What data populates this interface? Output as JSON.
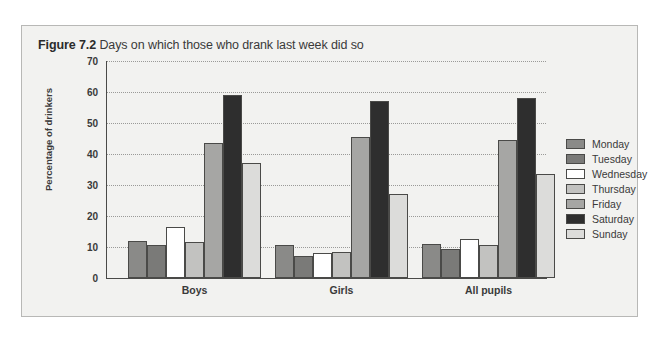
{
  "figure": {
    "number": "Figure 7.2",
    "title": "Days on which those who drank last week did so"
  },
  "chart_data": {
    "type": "bar",
    "title": "Days on which those who drank last week did so",
    "xlabel": "",
    "ylabel": "Percentage of drinkers",
    "ylim": [
      0,
      70
    ],
    "ytick_labels": [
      "0",
      "10",
      "20",
      "30",
      "40",
      "50",
      "60",
      "70"
    ],
    "ytick_values": [
      0,
      10,
      20,
      30,
      40,
      50,
      60,
      70
    ],
    "grid": true,
    "legend_position": "right",
    "categories": [
      "Boys",
      "Girls",
      "All pupils"
    ],
    "series": [
      {
        "name": "Monday",
        "color": "#8a8a88",
        "values": [
          12.0,
          10.5,
          11.0
        ]
      },
      {
        "name": "Tuesday",
        "color": "#7a7a78",
        "values": [
          10.5,
          7.0,
          9.5
        ]
      },
      {
        "name": "Wednesday",
        "color": "#ffffff",
        "values": [
          16.5,
          8.0,
          12.5
        ]
      },
      {
        "name": "Thursday",
        "color": "#c2c2c0",
        "values": [
          11.5,
          8.5,
          10.5
        ]
      },
      {
        "name": "Friday",
        "color": "#a6a6a4",
        "values": [
          43.5,
          45.5,
          44.5
        ]
      },
      {
        "name": "Saturday",
        "color": "#2e2e2e",
        "values": [
          59.0,
          57.0,
          58.0
        ]
      },
      {
        "name": "Sunday",
        "color": "#dcdcda",
        "values": [
          37.0,
          27.0,
          33.5
        ]
      }
    ]
  }
}
